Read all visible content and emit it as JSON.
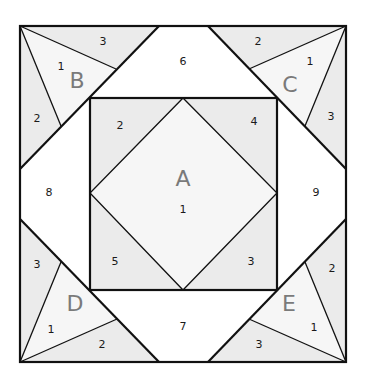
{
  "diagram": {
    "colors": {
      "shaded": "#ebebeb",
      "light": "#f6f6f6",
      "white": "#ffffff",
      "stroke": "#111111",
      "section_letter": "#7a7a7a"
    },
    "sections": {
      "A": {
        "letter": "A",
        "pieces": {
          "p1": "1",
          "p2": "2",
          "p3": "3",
          "p4": "4",
          "p5": "5"
        }
      },
      "B": {
        "letter": "B",
        "pieces": {
          "p1": "1",
          "p2": "2",
          "p3": "3"
        }
      },
      "C": {
        "letter": "C",
        "pieces": {
          "p1": "1",
          "p2": "2",
          "p3": "3"
        }
      },
      "D": {
        "letter": "D",
        "pieces": {
          "p1": "1",
          "p2": "2",
          "p3": "3"
        }
      },
      "E": {
        "letter": "E",
        "pieces": {
          "p1": "1",
          "p2": "2",
          "p3": "3"
        }
      }
    },
    "standalone_pieces": {
      "p6": "6",
      "p7": "7",
      "p8": "8",
      "p9": "9"
    }
  }
}
